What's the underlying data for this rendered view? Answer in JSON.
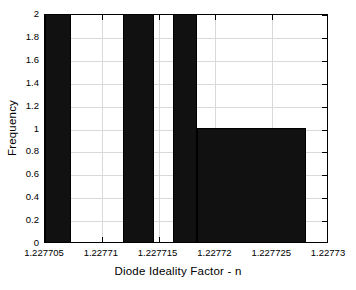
{
  "chart_data": {
    "type": "bar",
    "title": "",
    "xlabel": "Diode Ideality Factor - n",
    "ylabel": "Frequency",
    "xlim": [
      1.227705,
      1.22773
    ],
    "ylim": [
      0,
      2
    ],
    "grid": true,
    "legend": null,
    "xticks": [
      "1.227705",
      "1.22771",
      "1.227715",
      "1.22772",
      "1.227725",
      "1.22773"
    ],
    "xtick_values": [
      1.227705,
      1.22771,
      1.227715,
      1.22772,
      1.227725,
      1.22773
    ],
    "yticks": [
      "0",
      "0.2",
      "0.4",
      "0.6",
      "0.8",
      "1",
      "1.2",
      "1.4",
      "1.6",
      "1.8",
      "2"
    ],
    "ytick_values": [
      0,
      0.2,
      0.4,
      0.6,
      0.8,
      1,
      1.2,
      1.4,
      1.6,
      1.8,
      2
    ],
    "bin_edges": [
      1.227705,
      1.2277073,
      1.2277812,
      1.2277838,
      1.2277917,
      1.2277944,
      1.2278024,
      1.2279
    ],
    "bars": [
      {
        "label": "bin-1",
        "x_start": 1.227705,
        "x_end": 1.2277073,
        "value": 2
      },
      {
        "label": "bin-2",
        "x_start": 1.2277119,
        "x_end": 1.2277146,
        "value": 2
      },
      {
        "label": "bin-3",
        "x_start": 1.2277163,
        "x_end": 1.2277184,
        "value": 2
      },
      {
        "label": "bin-4",
        "x_start": 1.2277184,
        "x_end": 1.227728,
        "value": 1
      }
    ],
    "bar_color": "#111111",
    "grid_color": "#d9d9d9",
    "axis_color": "#000000",
    "background": "#ffffff"
  },
  "figure": {
    "x_axis_title": "Diode Ideality Factor - n",
    "y_axis_title": "Frequency"
  }
}
